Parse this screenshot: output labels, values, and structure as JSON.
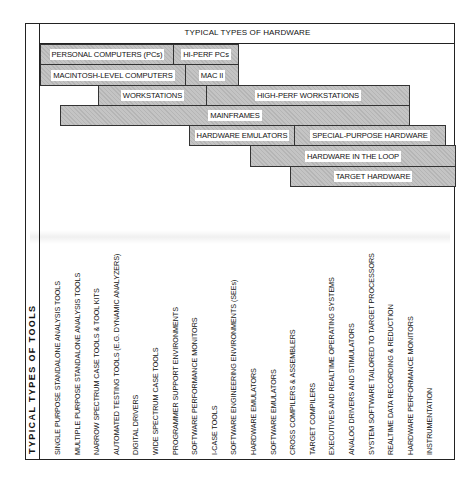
{
  "diagram": {
    "hardware_title": "TYPICAL TYPES OF HARDWARE",
    "tools_title": "TYPICAL  TYPES  OF  TOOLS",
    "hardware_bars": [
      {
        "label": "PERSONAL COMPUTERS (PCs)",
        "left": 40,
        "top": 44,
        "width": 134,
        "height": 21
      },
      {
        "label": "HI-PERF PCs",
        "left": 173,
        "top": 44,
        "width": 66,
        "height": 21
      },
      {
        "label": "MACINTOSH-LEVEL COMPUTERS",
        "left": 40,
        "top": 64,
        "width": 146,
        "height": 22
      },
      {
        "label": "MAC II",
        "left": 185,
        "top": 64,
        "width": 54,
        "height": 22
      },
      {
        "label": "WORKSTATIONS",
        "left": 98,
        "top": 85,
        "width": 109,
        "height": 21
      },
      {
        "label": "HIGH-PERF WORKSTATIONS",
        "left": 206,
        "top": 85,
        "width": 204,
        "height": 21
      },
      {
        "label": "MAINFRAMES",
        "left": 60,
        "top": 105,
        "width": 350,
        "height": 21
      },
      {
        "label": "HARDWARE EMULATORS",
        "left": 189,
        "top": 125,
        "width": 106,
        "height": 21
      },
      {
        "label": "SPECIAL-PURPOSE HARDWARE",
        "left": 294,
        "top": 125,
        "width": 152,
        "height": 21
      },
      {
        "label": "HARDWARE IN THE LOOP",
        "left": 250,
        "top": 145,
        "width": 206,
        "height": 22
      },
      {
        "label": "TARGET HARDWARE",
        "left": 290,
        "top": 166,
        "width": 166,
        "height": 21
      }
    ],
    "tools": [
      "SINGLE PURPOSE  STANDALONE ANALYSIS TOOLS",
      "MULTIPLE PURPOSE STANDALONE ANALYSIS TOOLS",
      "NARROW SPECTRUM CASE TOOLS & TOOL KITS",
      "AUTOMATED TESTING TOOLS (E.G. DYNAMIC ANALYZERS)",
      "DIGITAL DRIVERS",
      "WIDE SPECTRUM CASE TOOLS",
      "PROGRAMMER SUPPORT ENVIRONMENTS",
      "SOFTWARE PERFORMANCE MONITORS",
      "I-CASE TOOLS",
      "SOFTWARE ENGINEERING ENVIRONMENTS (SEEs)",
      "HARDWARE EMULATORS",
      "SOFTWARE EMULATORS",
      "CROSS COMPILERS & ASSEMBLERS",
      "TARGET COMPILERS",
      "EXECUTIVES AND REALTIME OPERATING SYSTEMS",
      "ANALOG DRIVERS AND STIMULATORS",
      "SYSTEM SOFTWARE TAILORED TO TARGET PROCESSORS",
      "REALTIME DATA RECORDING & REDUCTION",
      "HARDWARE PERFORMANCE MONITORS",
      "INSTRUMENTATION"
    ],
    "colors": {
      "bar_fill": "#c4c4c4",
      "border": "#222222",
      "label_bg": "#ffffff"
    }
  }
}
